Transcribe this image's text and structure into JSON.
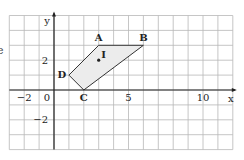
{
  "page": {
    "clipped_text": "e"
  },
  "chart_data": {
    "type": "diagram",
    "title": "",
    "xlabel": "x",
    "ylabel": "y",
    "grid": true,
    "xlim": [
      -3,
      12
    ],
    "ylim": [
      -4,
      5
    ],
    "x_tick_labels": [
      {
        "value": -2,
        "label": "−2"
      },
      {
        "value": 0,
        "label": "0"
      },
      {
        "value": 5,
        "label": "5"
      },
      {
        "value": 10,
        "label": "10"
      }
    ],
    "y_tick_labels": [
      {
        "value": 2,
        "label": "2"
      },
      {
        "value": -2,
        "label": "−2"
      }
    ],
    "polygon": {
      "name": "ABCD",
      "vertices": [
        {
          "label": "A",
          "x": 3,
          "y": 3
        },
        {
          "label": "B",
          "x": 6,
          "y": 3
        },
        {
          "label": "C",
          "x": 2,
          "y": 0
        },
        {
          "label": "D",
          "x": 1,
          "y": 1
        }
      ],
      "fill": "#ececec",
      "stroke": "#333333"
    },
    "points": [
      {
        "label": "I",
        "x": 3,
        "y": 2
      }
    ]
  },
  "colors": {
    "grid": "#b8b8b8",
    "axis": "#222222",
    "fill": "#ececec"
  }
}
